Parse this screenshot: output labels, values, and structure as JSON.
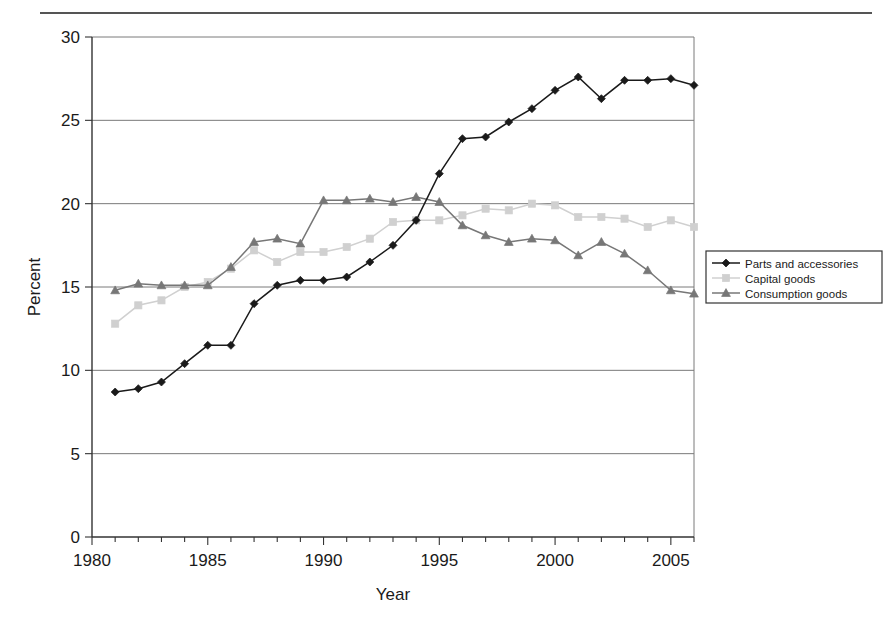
{
  "chart_data": {
    "type": "line",
    "title": "",
    "xlabel": "Year",
    "ylabel": "Percent",
    "xlim": [
      1980,
      2006
    ],
    "ylim": [
      0,
      30
    ],
    "ytick_step": 5,
    "yticks": [
      0,
      5,
      10,
      15,
      20,
      25,
      30
    ],
    "xticks_labeled": [
      1980,
      1985,
      1990,
      1995,
      2000,
      2005
    ],
    "xtick_step_minor": 1,
    "grid": "horizontal",
    "legend_position": "right-outside",
    "x": [
      1981,
      1982,
      1983,
      1984,
      1985,
      1986,
      1987,
      1988,
      1989,
      1990,
      1991,
      1992,
      1993,
      1994,
      1995,
      1996,
      1997,
      1998,
      1999,
      2000,
      2001,
      2002,
      2003,
      2004,
      2005,
      2006
    ],
    "series": [
      {
        "name": "Parts and accessories",
        "marker": "diamond",
        "color": "#1a1a1a",
        "values": [
          8.7,
          8.9,
          9.3,
          10.4,
          11.5,
          11.5,
          14.0,
          15.1,
          15.4,
          15.4,
          15.6,
          16.5,
          17.5,
          19.0,
          21.8,
          23.9,
          24.0,
          24.9,
          25.7,
          26.8,
          27.6,
          26.3,
          27.4,
          27.4,
          27.5,
          27.1
        ]
      },
      {
        "name": "Capital goods",
        "marker": "square",
        "color": "#d0d0d0",
        "values": [
          12.8,
          13.9,
          14.2,
          15.0,
          15.3,
          16.1,
          17.2,
          16.5,
          17.1,
          17.1,
          17.4,
          17.9,
          18.9,
          19.0,
          19.0,
          19.3,
          19.7,
          19.6,
          20.0,
          19.9,
          19.2,
          19.2,
          19.1,
          18.6,
          19.0,
          18.6
        ]
      },
      {
        "name": "Consumption goods",
        "marker": "triangle",
        "color": "#777777",
        "values": [
          14.8,
          15.2,
          15.1,
          15.1,
          15.1,
          16.2,
          17.7,
          17.9,
          17.6,
          20.2,
          20.2,
          20.3,
          20.1,
          20.4,
          20.1,
          18.7,
          18.1,
          17.7,
          17.9,
          17.8,
          16.9,
          17.7,
          17.0,
          16.0,
          14.8,
          14.6
        ]
      }
    ]
  }
}
